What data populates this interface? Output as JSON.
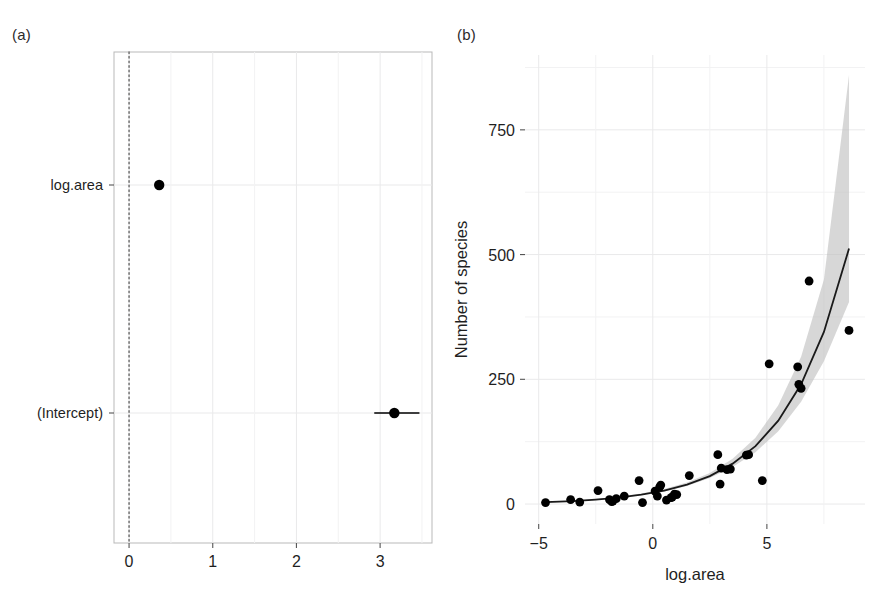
{
  "figure": {
    "panel_a_label": "(a)",
    "panel_b_label": "(b)"
  },
  "chart_data": [
    {
      "id": "panel-a",
      "type": "scatter",
      "title": "",
      "subtitle": "",
      "xlabel": "",
      "ylabel": "",
      "orientation": "horizontal",
      "grid": true,
      "legend": null,
      "xlim": [
        -0.18,
        3.62
      ],
      "xticks": [
        0,
        1,
        2,
        3
      ],
      "xticklabels": [
        "0",
        "1",
        "2",
        "3"
      ],
      "categories": [
        "(Intercept)",
        "log.area"
      ],
      "reference_line": {
        "x": 0,
        "style": "dotted",
        "color": "#777777"
      },
      "points": [
        {
          "term": "log.area",
          "estimate": 0.36,
          "conf_low": 0.34,
          "conf_high": 0.38
        },
        {
          "term": "(Intercept)",
          "estimate": 3.17,
          "conf_low": 2.93,
          "conf_high": 3.47
        }
      ]
    },
    {
      "id": "panel-b",
      "type": "scatter",
      "title": "",
      "subtitle": "",
      "xlabel": "log.area",
      "ylabel": "Number of species",
      "grid": true,
      "legend": null,
      "xlim": [
        -5.6,
        9.3
      ],
      "ylim": [
        -40,
        900
      ],
      "xticks": [
        -5,
        0,
        5
      ],
      "xticklabels": [
        "−5",
        "0",
        "5"
      ],
      "yticks": [
        0,
        250,
        500,
        750
      ],
      "yticklabels": [
        "0",
        "250",
        "500",
        "750"
      ],
      "x": [
        -4.7,
        -3.6,
        -3.2,
        -2.4,
        -1.9,
        -1.8,
        -1.75,
        -1.6,
        -1.25,
        -0.6,
        -0.45,
        0.1,
        0.2,
        0.3,
        0.35,
        0.6,
        0.8,
        0.85,
        0.95,
        1.05,
        1.6,
        2.85,
        2.95,
        3.0,
        3.25,
        3.4,
        4.1,
        4.2,
        4.8,
        5.1,
        6.35,
        6.4,
        6.5,
        6.85,
        8.6
      ],
      "y": [
        3,
        9,
        4,
        27,
        9,
        5,
        6,
        11,
        16,
        47,
        3,
        26,
        16,
        34,
        38,
        8,
        13,
        14,
        20,
        19,
        57,
        99,
        40,
        72,
        69,
        70,
        98,
        99,
        47,
        281,
        275,
        240,
        232,
        447,
        348
      ],
      "fit_line": {
        "name": "fitted mean",
        "x": [
          -4.7,
          -3.5,
          -2.5,
          -1.5,
          -0.5,
          0.5,
          1.5,
          2.5,
          3.5,
          4.5,
          5.5,
          6.5,
          7.5,
          8.6
        ],
        "y": [
          4,
          6,
          9,
          13,
          19,
          27,
          39,
          56,
          81,
          116,
          167,
          240,
          345,
          512
        ]
      },
      "confidence_ribbon": {
        "name": "95% confidence band",
        "x": [
          -4.7,
          -3.5,
          -2.5,
          -1.5,
          -0.5,
          0.5,
          1.5,
          2.5,
          3.5,
          4.5,
          5.5,
          6.5,
          7.5,
          8.6
        ],
        "lower": [
          3,
          5,
          8,
          12,
          18,
          25,
          36,
          52,
          74,
          104,
          146,
          205,
          286,
          405
        ],
        "upper": [
          5,
          7,
          10,
          15,
          21,
          30,
          43,
          62,
          91,
          133,
          198,
          295,
          450,
          860
        ]
      }
    }
  ]
}
